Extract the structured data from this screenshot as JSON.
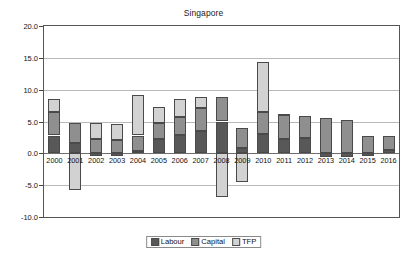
{
  "chart_data": {
    "type": "bar",
    "title": "Singapore",
    "subtitle": "",
    "xlabel": "",
    "ylabel": "",
    "stacked": true,
    "grid": true,
    "legend_position": "bottom",
    "ylim": [
      -10.0,
      20.0
    ],
    "ytick_labels": [
      "20.0",
      "15.0",
      "10.0",
      "5.0",
      "0.0",
      "-5.0",
      "-10.0"
    ],
    "ytick_values": [
      20.0,
      15.0,
      10.0,
      5.0,
      0.0,
      -5.0,
      -10.0
    ],
    "categories": [
      "2000",
      "2001",
      "2002",
      "2003",
      "2004",
      "2005",
      "2006",
      "2007",
      "2008",
      "2009",
      "2010",
      "2011",
      "2012",
      "2013",
      "2014",
      "2015",
      "2016"
    ],
    "series": [
      {
        "name": "Labour",
        "color": "#585858",
        "values": [
          2.8,
          1.7,
          -0.4,
          -0.4,
          0.3,
          2.3,
          2.9,
          3.5,
          5.0,
          0.8,
          3.0,
          2.2,
          2.4,
          -0.5,
          -0.5,
          -0.4,
          0.6
        ]
      },
      {
        "name": "Capital",
        "color": "#8f8f8f",
        "values": [
          3.7,
          3.1,
          2.3,
          2.1,
          2.5,
          2.4,
          2.8,
          3.6,
          3.8,
          3.2,
          3.5,
          3.8,
          3.5,
          5.6,
          5.2,
          2.8,
          2.1
        ]
      },
      {
        "name": "TFP",
        "color": "#d2d2d2",
        "values": [
          2.0,
          -5.7,
          2.4,
          2.5,
          6.4,
          2.6,
          2.9,
          1.7,
          -6.8,
          -4.5,
          7.8,
          0.2,
          0.0,
          0.0,
          0.0,
          0.0,
          0.0
        ]
      }
    ],
    "totals_positive": [
      8.5,
      4.8,
      4.7,
      4.6,
      9.2,
      7.3,
      8.6,
      8.8,
      8.8,
      4.0,
      14.3,
      6.2,
      5.9,
      5.6,
      5.2,
      2.8,
      2.7
    ],
    "totals_negative": [
      0.0,
      -5.7,
      -0.4,
      -0.4,
      0.0,
      0.0,
      0.0,
      0.0,
      -6.8,
      -4.5,
      0.0,
      0.0,
      0.0,
      -0.5,
      -0.5,
      -0.4,
      0.0
    ],
    "legend": [
      {
        "label": "Labour",
        "color": "#585858"
      },
      {
        "label": "Capital",
        "color": "#8f8f8f"
      },
      {
        "label": "TFP",
        "color": "#d2d2d2"
      }
    ]
  }
}
